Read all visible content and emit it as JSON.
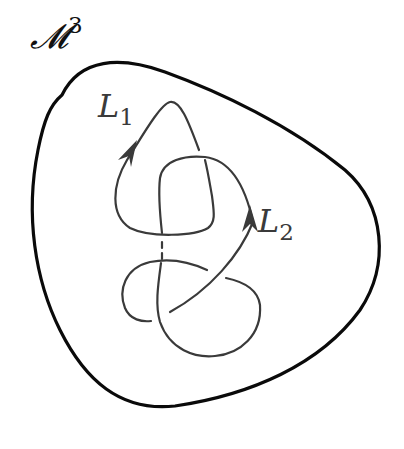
{
  "diagram": {
    "manifold": {
      "symbol": "𝓜",
      "superscript": "3",
      "stroke_color": "#0a0a0a"
    },
    "knots": [
      {
        "name": "L",
        "subscript": "1",
        "stroke_color": "#3a3a3a",
        "orientation": "arrow-up-left-strand"
      },
      {
        "name": "L",
        "subscript": "2",
        "stroke_color": "#3a3a3a",
        "orientation": "arrow-up-right-strand"
      }
    ],
    "background": "#ffffff"
  }
}
